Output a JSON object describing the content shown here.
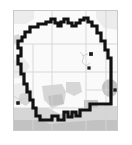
{
  "map": {
    "title": "",
    "frame": {
      "border_color": "#c9c9c9",
      "background_color": "#ffffff",
      "x": 13,
      "y": 10,
      "width": 105,
      "height": 121
    },
    "background_color": "#ffffff",
    "layers": [
      {
        "name": "basemap-background",
        "label": "Base map",
        "fill": "#f7f7f7"
      },
      {
        "name": "county-grid-lines",
        "label": "County / grid lines",
        "stroke": "#d7d7d7",
        "stroke_width": 0.8
      },
      {
        "name": "landcover-shading-light",
        "label": "Land cover (light)",
        "fill": "#e3e3e3"
      },
      {
        "name": "landcover-shading-medium",
        "label": "Land cover (medium)",
        "fill": "#cfcfcf"
      },
      {
        "name": "landcover-shading-dark",
        "label": "Land cover (dark)",
        "fill": "#bdbdbd"
      },
      {
        "name": "jurisdiction-boundary",
        "label": "Jurisdiction boundary",
        "stroke": "#111111",
        "stroke_width": 3.2
      },
      {
        "name": "point-markers",
        "label": "Site markers",
        "fill": "#1a1a1a",
        "count": 4
      }
    ],
    "boundary_path": "M 25 37 L 25 32 L 30 32 L 30 27 L 38 27 L 38 24 L 46 24 L 46 22 L 51 22 L 51 19 L 55 19 L 55 23 L 58 23 L 58 26 L 61 26 L 61 22 L 64 22 L 64 19 L 68 19 L 68 23 L 72 23 L 72 26 L 76 26 L 76 23 L 80 23 L 80 20 L 84 20 L 84 18 L 88 18 L 88 22 L 92 22 L 92 26 L 97 26 L 97 33 L 101 33 L 101 41 L 105 41 L 105 50 L 108 50 L 108 58 L 111 58 L 111 104 L 90 104 L 90 110 L 80 110 L 80 116 L 76 116 L 76 112 L 72 112 L 72 117 L 68 117 L 68 112 L 64 112 L 64 120 L 58 120 L 58 116 L 52 116 L 52 120 L 40 120 L 40 116 L 36 116 L 36 108 L 33 108 L 33 100 L 30 100 L 30 92 L 27 92 L 27 84 L 24 84 L 24 74 L 21 74 L 21 64 L 18 64 L 18 56 L 21 56 L 21 48 L 18 48 L 18 41 L 22 41 L 22 37 Z",
    "markers": [
      {
        "name": "site-marker-1",
        "x": 91,
        "y": 54,
        "size": 3
      },
      {
        "name": "site-marker-2",
        "x": 89,
        "y": 68,
        "size": 2.6
      },
      {
        "name": "site-marker-3",
        "x": 115,
        "y": 90,
        "size": 2.6
      },
      {
        "name": "site-marker-4",
        "x": 18,
        "y": 103,
        "size": 2.8
      }
    ],
    "grid_lines": [
      {
        "name": "grid-vertical-1",
        "x1": 52,
        "y1": 10,
        "x2": 52,
        "y2": 131
      },
      {
        "name": "grid-vertical-2",
        "x1": 86,
        "y1": 10,
        "x2": 86,
        "y2": 131
      },
      {
        "name": "grid-vertical-3",
        "x1": 106,
        "y1": 10,
        "x2": 106,
        "y2": 131
      },
      {
        "name": "grid-vertical-4",
        "x1": 33,
        "y1": 44,
        "x2": 33,
        "y2": 131
      },
      {
        "name": "grid-horizontal-1",
        "x1": 13,
        "y1": 44,
        "x2": 118,
        "y2": 44
      },
      {
        "name": "grid-horizontal-2",
        "x1": 13,
        "y1": 72,
        "x2": 118,
        "y2": 72
      },
      {
        "name": "grid-horizontal-3",
        "x1": 13,
        "y1": 108,
        "x2": 118,
        "y2": 108
      },
      {
        "name": "grid-horizontal-4",
        "x1": 86,
        "y1": 90,
        "x2": 118,
        "y2": 90
      }
    ],
    "scale_text": "",
    "attribution": ""
  }
}
